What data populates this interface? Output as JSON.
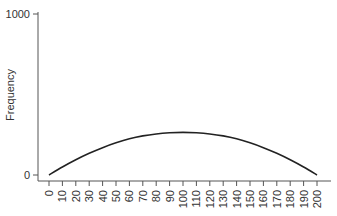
{
  "chart_data": {
    "type": "line",
    "title": "",
    "xlabel": "",
    "ylabel": "Frequency",
    "ylim": [
      0,
      1000
    ],
    "xlim": [
      0,
      200
    ],
    "y_ticks": [
      0,
      1000
    ],
    "x_ticks": [
      0,
      10,
      20,
      30,
      40,
      50,
      60,
      70,
      80,
      90,
      100,
      110,
      120,
      130,
      140,
      150,
      160,
      170,
      180,
      190,
      200
    ],
    "grid": false,
    "legend": null,
    "series": [
      {
        "name": "Frequency",
        "x": [
          0,
          10,
          20,
          30,
          40,
          50,
          60,
          70,
          80,
          90,
          100,
          110,
          120,
          130,
          140,
          150,
          160,
          170,
          180,
          190,
          200
        ],
        "values": [
          0,
          50,
          95,
          135,
          170,
          200,
          225,
          243,
          255,
          262,
          265,
          262,
          255,
          243,
          225,
          200,
          170,
          135,
          95,
          50,
          0
        ]
      }
    ],
    "colors": {
      "line": "#222222",
      "axis": "#555555"
    }
  }
}
